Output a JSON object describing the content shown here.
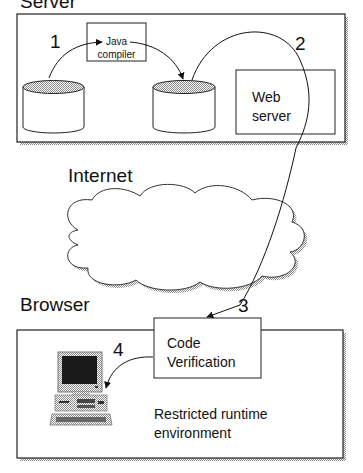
{
  "sections": {
    "server": "Server",
    "internet": "Internet",
    "browser": "Browser"
  },
  "steps": [
    "1",
    "2",
    "3",
    "4"
  ],
  "nodes": {
    "java_compiler": [
      "Java",
      "compiler"
    ],
    "web_server": [
      "Web",
      "server"
    ],
    "code_verification": [
      "Code",
      "Verification"
    ],
    "runtime": [
      "Restricted runtime",
      "environment"
    ]
  },
  "colors": {
    "stroke": "#222222",
    "shadow": "#9a9a9a",
    "cylinder_top": "#bdbdbd",
    "background": "#ffffff"
  }
}
